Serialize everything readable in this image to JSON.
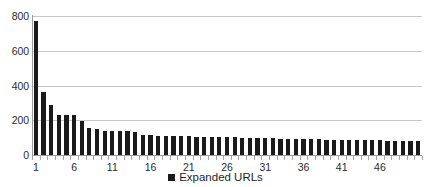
{
  "chart_data": {
    "type": "bar",
    "title": "",
    "xlabel": "",
    "ylabel": "",
    "ylim": [
      0,
      800
    ],
    "ytick_values": [
      0,
      200,
      400,
      600,
      800
    ],
    "ytick_labels": [
      "0",
      "200",
      "400",
      "600",
      "800"
    ],
    "grid": true,
    "gridlines_at": [
      200,
      400,
      600,
      800
    ],
    "legend_position": "bottom-center",
    "legend": [
      "Expanded URLs"
    ],
    "series": [
      {
        "name": "Expanded URLs",
        "color": "#1a1a1a",
        "values": [
          770,
          360,
          285,
          232,
          228,
          233,
          195,
          155,
          152,
          140,
          141,
          138,
          136,
          133,
          116,
          114,
          112,
          110,
          109,
          108,
          107,
          106,
          105,
          104,
          103,
          102,
          101,
          100,
          99,
          98,
          97,
          96,
          95,
          94,
          93,
          92,
          91,
          90,
          89,
          88,
          88,
          87,
          86,
          85,
          85,
          84,
          83,
          82,
          81,
          80,
          79
        ]
      }
    ],
    "categories": [
      "1",
      "2",
      "3",
      "4",
      "5",
      "6",
      "7",
      "8",
      "9",
      "10",
      "11",
      "12",
      "13",
      "14",
      "15",
      "16",
      "17",
      "18",
      "19",
      "20",
      "21",
      "22",
      "23",
      "24",
      "25",
      "26",
      "27",
      "28",
      "29",
      "30",
      "31",
      "32",
      "33",
      "34",
      "35",
      "36",
      "37",
      "38",
      "39",
      "40",
      "41",
      "42",
      "43",
      "44",
      "45",
      "46",
      "47",
      "48",
      "49",
      "50",
      "51"
    ],
    "xtick_labeled_categories": [
      "1",
      "6",
      "11",
      "16",
      "21",
      "26",
      "31",
      "36",
      "41",
      "46"
    ],
    "xtick_labeled_indices": [
      0,
      5,
      10,
      15,
      20,
      25,
      30,
      35,
      40,
      45
    ],
    "bar_count": 51,
    "axis_color": "#9a9a9a",
    "grid_color": "#c8c8c8",
    "background_color": "#ffffff",
    "text_color": "#2b2b2b"
  },
  "legend": {
    "marker_name": "legend-square-marker",
    "label": "Expanded URLs"
  }
}
